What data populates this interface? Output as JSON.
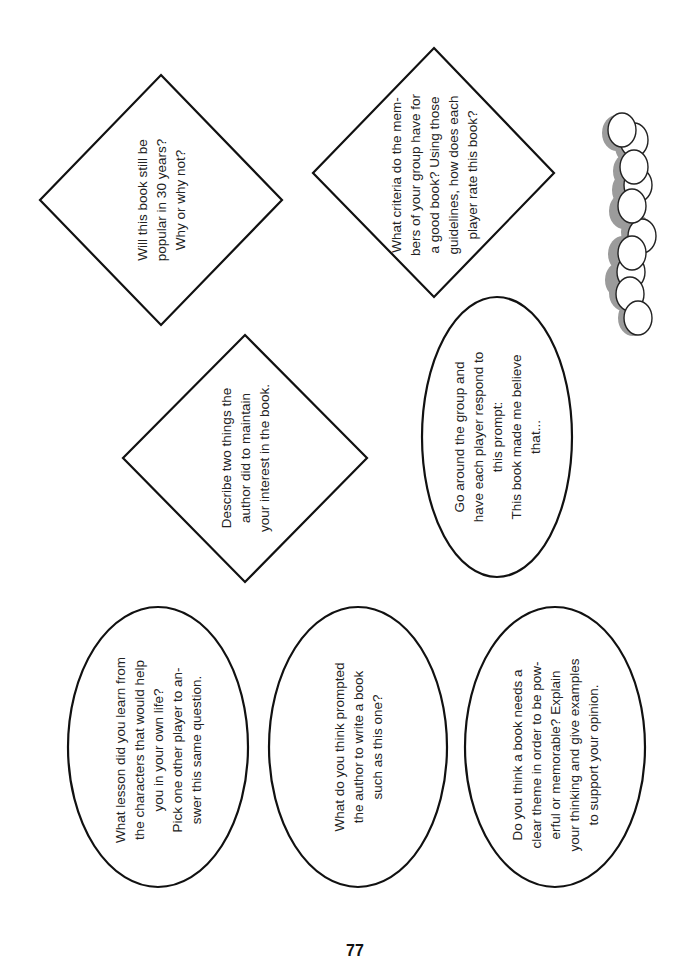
{
  "page": {
    "page_number": "77",
    "ink_color": "#111111",
    "chip_shadow_color": "#8a8a8a"
  },
  "cards": {
    "diamonds": [
      {
        "id": "popular-30-years",
        "text": "Will this book still be\npopular in 30 years?\nWhy or why not?"
      },
      {
        "id": "maintain-interest",
        "text": "Describe two things the\nauthor did to maintain\nyour interest in the book."
      },
      {
        "id": "group-criteria",
        "text": "What criteria do the mem-\nbers of your group have for\na good book? Using those\nguidelines, how does each\nplayer rate this book?"
      }
    ],
    "ovals": [
      {
        "id": "book-made-me-believe",
        "text": "Go around the group and\nhave each player respond to\nthis prompt:\nThis book made me believe\nthat..."
      },
      {
        "id": "lesson-from-characters",
        "text": "What lesson did you learn from\nthe characters that would help\nyou in your own life?\nPick one other player to an-\nswer this same question."
      },
      {
        "id": "what-prompted-author",
        "text": "What do you think prompted\nthe author to write a book\nsuch as this one?"
      },
      {
        "id": "clear-theme",
        "text": "Do you think a book needs a\nclear theme in order to be pow-\nerful or memorable? Explain\nyour thinking and give examples\nto support your opinion."
      }
    ]
  },
  "decorations": {
    "chip_stack": {
      "label": "stack-of-game-chips",
      "count": 11
    }
  }
}
